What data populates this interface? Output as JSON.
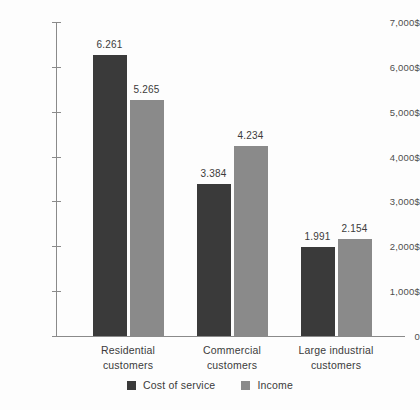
{
  "chart_data": {
    "type": "bar",
    "title": "",
    "subtitle": "",
    "xlabel": "",
    "ylabel": "",
    "grid": false,
    "legend_position": "bottom",
    "categories": [
      "Residential\ncustomers",
      "Commercial\ncustomers",
      "Large industrial\ncustomers"
    ],
    "category_lines": [
      [
        "Residential",
        "customers"
      ],
      [
        "Commercial",
        "customers"
      ],
      [
        "Large industrial",
        "customers"
      ]
    ],
    "series": [
      {
        "name": "Cost of service",
        "color": "#3a3a3a",
        "values": [
          6261,
          3384,
          1991
        ],
        "value_labels": [
          "6.261",
          "3.384",
          "1.991"
        ]
      },
      {
        "name": "Income",
        "color": "#8a8a8a",
        "values": [
          5265,
          4234,
          2154
        ],
        "value_labels": [
          "5.265",
          "4.234",
          "2.154"
        ]
      }
    ],
    "ylim": [
      0,
      7000
    ],
    "ytick_values": [
      0,
      1000,
      2000,
      3000,
      4000,
      5000,
      6000,
      7000
    ],
    "ytick_labels": [
      "0",
      "1,000$",
      "2,000$",
      "3,000$",
      "4,000$",
      "5,000$",
      "6,000$",
      "7,000$"
    ]
  },
  "colors": {
    "background": "#fdfdfd",
    "axis": "#8a8a8a",
    "text": "#3b3b3b",
    "tick_text": "#4e4e4e",
    "series_dark": "#3a3a3a",
    "series_light": "#8a8a8a"
  }
}
